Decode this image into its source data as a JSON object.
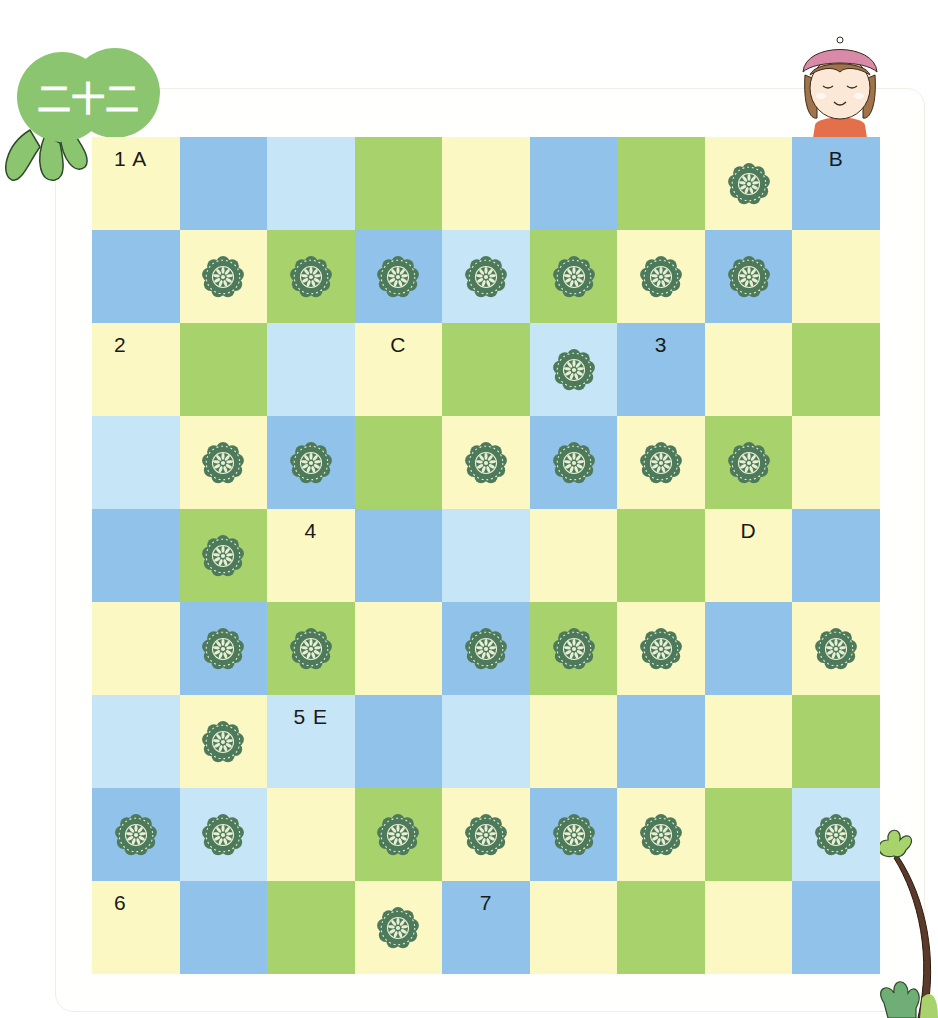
{
  "badge": {
    "text": "二十二",
    "color": "#8cc56f"
  },
  "board": {
    "columns": 9,
    "rows": 9,
    "colors": {
      "Y": "#fcf8c4",
      "B": "#90c2ea",
      "L": "#c6e6f7",
      "G": "#a8d36c"
    },
    "flower_color": "#4e7a5c",
    "grid": [
      [
        {
          "c": "Y",
          "label": "1 A"
        },
        {
          "c": "B"
        },
        {
          "c": "L"
        },
        {
          "c": "G"
        },
        {
          "c": "Y"
        },
        {
          "c": "B"
        },
        {
          "c": "G"
        },
        {
          "c": "Y",
          "flower": true
        },
        {
          "c": "B",
          "label": "B"
        }
      ],
      [
        {
          "c": "B"
        },
        {
          "c": "Y",
          "flower": true
        },
        {
          "c": "G",
          "flower": true
        },
        {
          "c": "B",
          "flower": true
        },
        {
          "c": "L",
          "flower": true
        },
        {
          "c": "G",
          "flower": true
        },
        {
          "c": "Y",
          "flower": true
        },
        {
          "c": "B",
          "flower": true
        },
        {
          "c": "Y"
        }
      ],
      [
        {
          "c": "Y",
          "label": "2"
        },
        {
          "c": "G"
        },
        {
          "c": "L"
        },
        {
          "c": "Y",
          "label": "C"
        },
        {
          "c": "G"
        },
        {
          "c": "L",
          "flower": true
        },
        {
          "c": "B",
          "label": "3"
        },
        {
          "c": "Y"
        },
        {
          "c": "G"
        }
      ],
      [
        {
          "c": "L"
        },
        {
          "c": "Y",
          "flower": true
        },
        {
          "c": "B",
          "flower": true
        },
        {
          "c": "G"
        },
        {
          "c": "Y",
          "flower": true
        },
        {
          "c": "B",
          "flower": true
        },
        {
          "c": "Y",
          "flower": true
        },
        {
          "c": "G",
          "flower": true
        },
        {
          "c": "Y"
        }
      ],
      [
        {
          "c": "B"
        },
        {
          "c": "G",
          "flower": true
        },
        {
          "c": "Y",
          "label": "4"
        },
        {
          "c": "B"
        },
        {
          "c": "L"
        },
        {
          "c": "Y"
        },
        {
          "c": "G"
        },
        {
          "c": "Y",
          "label": "D"
        },
        {
          "c": "B"
        }
      ],
      [
        {
          "c": "Y"
        },
        {
          "c": "B",
          "flower": true
        },
        {
          "c": "G",
          "flower": true
        },
        {
          "c": "Y"
        },
        {
          "c": "B",
          "flower": true
        },
        {
          "c": "G",
          "flower": true
        },
        {
          "c": "Y",
          "flower": true
        },
        {
          "c": "B"
        },
        {
          "c": "Y",
          "flower": true
        }
      ],
      [
        {
          "c": "L"
        },
        {
          "c": "Y",
          "flower": true
        },
        {
          "c": "L",
          "label": "5 E"
        },
        {
          "c": "B"
        },
        {
          "c": "L"
        },
        {
          "c": "Y"
        },
        {
          "c": "B"
        },
        {
          "c": "Y"
        },
        {
          "c": "G"
        }
      ],
      [
        {
          "c": "B",
          "flower": true
        },
        {
          "c": "L",
          "flower": true
        },
        {
          "c": "Y"
        },
        {
          "c": "G",
          "flower": true
        },
        {
          "c": "Y",
          "flower": true
        },
        {
          "c": "B",
          "flower": true
        },
        {
          "c": "Y",
          "flower": true
        },
        {
          "c": "G"
        },
        {
          "c": "L",
          "flower": true
        }
      ],
      [
        {
          "c": "Y",
          "label": "6"
        },
        {
          "c": "B"
        },
        {
          "c": "G"
        },
        {
          "c": "Y",
          "flower": true
        },
        {
          "c": "B",
          "label": "7"
        },
        {
          "c": "Y"
        },
        {
          "c": "G"
        },
        {
          "c": "Y"
        },
        {
          "c": "B"
        }
      ]
    ]
  }
}
